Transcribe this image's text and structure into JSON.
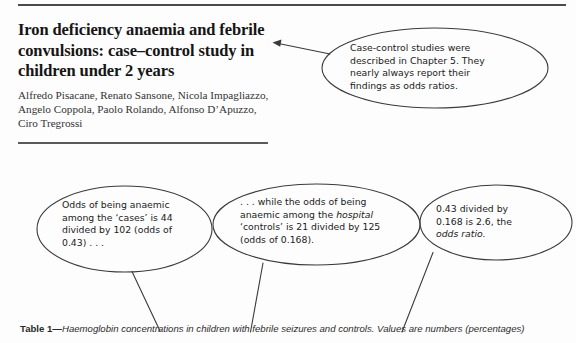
{
  "document": {
    "title": "Iron deficiency anaemia and febrile convulsions: case–control study in children under 2 years",
    "authors": "Alfredo Pisacane, Renato Sansone, Nicola Impagliazzo, Angelo Coppola, Paolo Rolando, Alfonso D’Apuzzo, Ciro Tregrossi",
    "table_caption": {
      "label": "Table 1—",
      "text": "Haemoglobin concentrations in children with febrile seizures and controls. Values are numbers (percentages)"
    }
  },
  "annotations": [
    {
      "id": "callout-0",
      "name": "annotation-case-control-studies",
      "line1": "Case-control studies were",
      "line2": "described in Chapter 5. They",
      "line3": "nearly always report their",
      "line4": "findings as odds ratios."
    },
    {
      "id": "callout-1",
      "name": "annotation-odds-cases",
      "line1": "Odds of being anaemic",
      "line2": "among the ‘cases’ is 44",
      "line3": "divided by 102 (odds of",
      "line4": "0.43) . . ."
    },
    {
      "id": "callout-2",
      "name": "annotation-odds-controls",
      "line1": ". . . while the odds of being",
      "line2a": "anaemic among the ",
      "line2b": "hospital",
      "line3": "‘controls’ is 21 divided by 125",
      "line4": "(odds of 0.168)."
    },
    {
      "id": "callout-3",
      "name": "annotation-odds-ratio-result",
      "line1": "0.43 divided by",
      "line2": "0.168 is 2.6, the",
      "line3": "odds ratio."
    }
  ],
  "colors": {
    "ink": "#1b1b1b",
    "rule": "#4a4a4a",
    "annotation_stroke": "#3a3a3a"
  }
}
